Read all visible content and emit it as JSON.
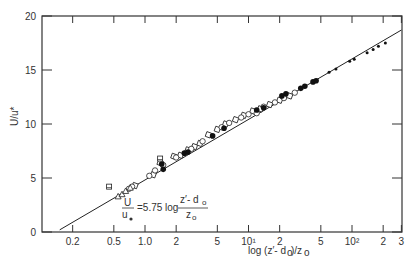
{
  "chart_data": {
    "type": "scatter",
    "title": "",
    "xlabel": "log (z' - d0)/z0",
    "ylabel": "U/u*",
    "x_scale": "log",
    "xlim": [
      0.13,
      300
    ],
    "ylim": [
      0,
      20
    ],
    "x_ticks": [
      0.2,
      0.5,
      1.0,
      2,
      5,
      10,
      20,
      50,
      100,
      200,
      300
    ],
    "x_tick_labels": [
      "0.2",
      "0.5",
      "1.0",
      "2",
      "5",
      "10¹",
      "2",
      "5",
      "10²",
      "2",
      "3"
    ],
    "y_ticks": [
      0,
      5,
      10,
      15,
      20
    ],
    "y_tick_labels": [
      "0",
      "5",
      "10",
      "15",
      "20"
    ],
    "grid": false,
    "annotation": "U/u* = 5.75 log (z' - d0)/z0",
    "fit_line": {
      "x": [
        0.15,
        300
      ],
      "y": [
        0.2,
        18.7
      ]
    },
    "series": [
      {
        "name": "open squares",
        "marker": "square-open",
        "points": [
          [
            0.8,
            4.3
          ],
          [
            1.2,
            5.3
          ],
          [
            1.4,
            6.4
          ],
          [
            1.9,
            7.0
          ],
          [
            2.2,
            7.1
          ],
          [
            2.6,
            7.6
          ],
          [
            3.0,
            7.9
          ],
          [
            3.4,
            8.2
          ],
          [
            4.1,
            9.0
          ],
          [
            5.0,
            9.5
          ],
          [
            6.0,
            10.0
          ],
          [
            7.5,
            10.4
          ],
          [
            9.0,
            10.8
          ],
          [
            11,
            11.2
          ],
          [
            13,
            11.4
          ],
          [
            16,
            11.8
          ],
          [
            20,
            12.2
          ],
          [
            25,
            12.6
          ]
        ]
      },
      {
        "name": "open circles",
        "marker": "circle-open",
        "points": [
          [
            0.7,
            4.0
          ],
          [
            0.75,
            4.2
          ],
          [
            1.1,
            5.2
          ],
          [
            1.25,
            5.7
          ],
          [
            1.5,
            6.2
          ],
          [
            2.0,
            6.9
          ],
          [
            2.8,
            7.7
          ],
          [
            3.6,
            8.4
          ],
          [
            5.5,
            9.7
          ],
          [
            6.5,
            10.1
          ],
          [
            8.5,
            10.6
          ],
          [
            10,
            10.9
          ],
          [
            12,
            11.0
          ],
          [
            14,
            11.6
          ],
          [
            18,
            12.0
          ],
          [
            22,
            12.4
          ],
          [
            28,
            12.9
          ]
        ]
      },
      {
        "name": "filled circles",
        "marker": "circle-filled",
        "points": [
          [
            1.45,
            6.3
          ],
          [
            1.5,
            5.8
          ],
          [
            2.4,
            7.3
          ],
          [
            2.6,
            7.4
          ],
          [
            4.5,
            8.9
          ],
          [
            5.8,
            9.6
          ],
          [
            12,
            11.3
          ],
          [
            14,
            11.5
          ],
          [
            21,
            12.6
          ],
          [
            23,
            12.8
          ],
          [
            32,
            13.3
          ],
          [
            35,
            13.5
          ],
          [
            42,
            13.9
          ],
          [
            45,
            14.0
          ]
        ]
      },
      {
        "name": "small dots",
        "marker": "dot",
        "points": [
          [
            60,
            14.8
          ],
          [
            70,
            15.1
          ],
          [
            95,
            15.8
          ],
          [
            105,
            16.0
          ],
          [
            140,
            16.6
          ],
          [
            160,
            16.9
          ],
          [
            180,
            17.2
          ],
          [
            210,
            17.5
          ]
        ]
      },
      {
        "name": "triangles",
        "marker": "triangle-open",
        "points": [
          [
            0.55,
            3.3
          ],
          [
            0.6,
            3.5
          ],
          [
            0.65,
            3.8
          ],
          [
            0.72,
            4.1
          ]
        ]
      },
      {
        "name": "flagged squares",
        "marker": "square-flag",
        "points": [
          [
            0.45,
            4.2
          ],
          [
            1.4,
            6.8
          ]
        ]
      }
    ]
  }
}
